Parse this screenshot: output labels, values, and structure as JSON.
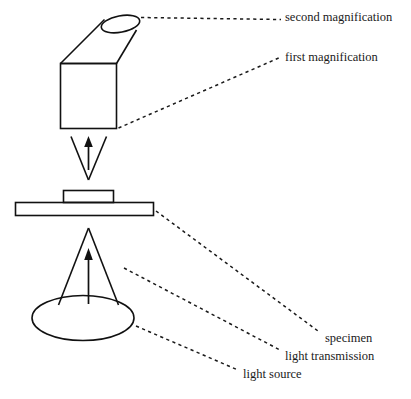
{
  "diagram": {
    "background_color": "#ffffff",
    "line_color": "#111111",
    "text_color": "#1a1a1a",
    "labels": [
      {
        "id": "second-magnification",
        "text": "second magnification",
        "x": 285,
        "y": 11
      },
      {
        "id": "first-magnification",
        "text": "first magnification",
        "x": 285,
        "y": 51
      },
      {
        "id": "specimen",
        "text": "specimen",
        "x": 325,
        "y": 332
      },
      {
        "id": "light-transmission",
        "text": "light transmission",
        "x": 285,
        "y": 350
      },
      {
        "id": "light-source",
        "text": "light source",
        "x": 243,
        "y": 368
      }
    ],
    "parts": [
      {
        "id": "eyepiece-tube",
        "role": "second magnification lens tube"
      },
      {
        "id": "objective-box",
        "role": "first magnification lens body"
      },
      {
        "id": "upper-light-cone",
        "role": "converging beam to objective"
      },
      {
        "id": "stage",
        "role": "microscope stage"
      },
      {
        "id": "specimen-block",
        "role": "specimen on stage"
      },
      {
        "id": "lower-light-cone",
        "role": "light transmission beam"
      },
      {
        "id": "light-source-ellipse",
        "role": "light source"
      }
    ]
  }
}
